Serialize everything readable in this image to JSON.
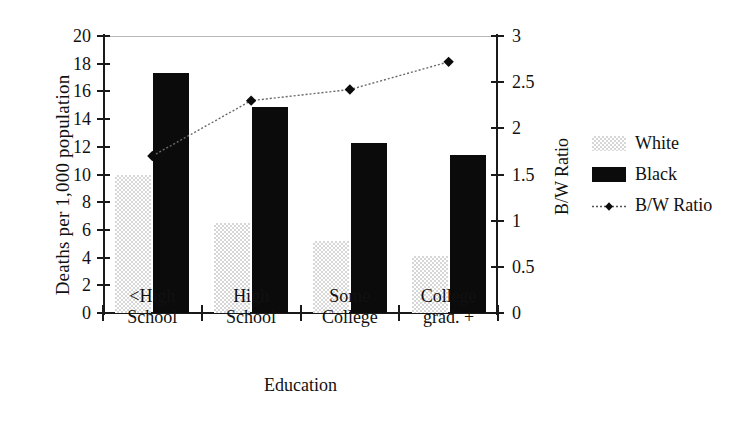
{
  "chart_data": {
    "type": "bar",
    "title": "",
    "categories": [
      "<High School",
      "High School",
      "Some College",
      "College grad. +"
    ],
    "category_lines": [
      [
        "<High",
        "School"
      ],
      [
        "High",
        "School"
      ],
      [
        "Some",
        "College"
      ],
      [
        "College",
        "grad. +"
      ]
    ],
    "xlabel": "Education",
    "ylabel": "Deaths per 1,000 population",
    "y2label": "B/W Ratio",
    "ylim": [
      0,
      20
    ],
    "y2lim": [
      0,
      3
    ],
    "yticks": [
      0,
      2,
      4,
      6,
      8,
      10,
      12,
      14,
      16,
      18,
      20
    ],
    "ytick_labels": [
      "0",
      "2",
      "4",
      "6",
      "8",
      "10",
      "12",
      "14",
      "16",
      "18",
      "20"
    ],
    "y2ticks": [
      0,
      0.5,
      1,
      1.5,
      2,
      2.5,
      3
    ],
    "y2tick_labels": [
      "0",
      "0.5",
      "1",
      "1.5",
      "2",
      "2.5",
      "3"
    ],
    "grid": "top-line-only",
    "legend_position": "right",
    "series": [
      {
        "name": "White",
        "type": "bar",
        "axis": "left",
        "color": "#d7d7d7",
        "values": [
          10.0,
          6.5,
          5.2,
          4.15
        ]
      },
      {
        "name": "Black",
        "type": "bar",
        "axis": "left",
        "color": "#0b0b0b",
        "values": [
          17.35,
          14.9,
          12.3,
          11.4
        ]
      },
      {
        "name": "B/W Ratio",
        "type": "line",
        "axis": "right",
        "color": "#3a3a3a",
        "marker": "diamond",
        "values": [
          1.7,
          2.3,
          2.42,
          2.72
        ]
      }
    ]
  },
  "legend": {
    "items": [
      {
        "label": "White",
        "marker": "swatch-white"
      },
      {
        "label": "Black",
        "marker": "swatch-black"
      },
      {
        "label": "B/W Ratio",
        "marker": "line-diamond"
      }
    ]
  }
}
